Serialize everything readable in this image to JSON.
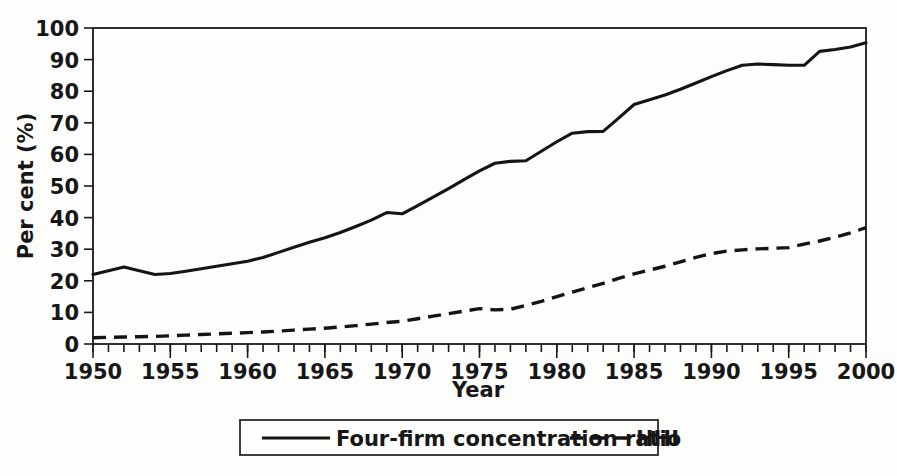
{
  "chart_data": {
    "type": "line",
    "title": "",
    "xlabel": "Year",
    "ylabel": "Per cent (%)",
    "xlim": [
      1950,
      2000
    ],
    "ylim": [
      0,
      100
    ],
    "grid": false,
    "legend_position": "bottom",
    "x_tick_labels": [
      "1950",
      "1955",
      "1960",
      "1965",
      "1970",
      "1975",
      "1980",
      "1985",
      "1990",
      "1995",
      "2000"
    ],
    "x_tick_values": [
      1950,
      1955,
      1960,
      1965,
      1970,
      1975,
      1980,
      1985,
      1990,
      1995,
      2000
    ],
    "x_minor_tick_step": 1,
    "y_tick_labels": [
      "0",
      "10",
      "20",
      "30",
      "40",
      "50",
      "60",
      "70",
      "80",
      "90",
      "100"
    ],
    "y_tick_values": [
      0,
      10,
      20,
      30,
      40,
      50,
      60,
      70,
      80,
      90,
      100
    ],
    "x": [
      1950,
      1951,
      1952,
      1953,
      1954,
      1955,
      1956,
      1957,
      1958,
      1959,
      1960,
      1961,
      1962,
      1963,
      1964,
      1965,
      1966,
      1967,
      1968,
      1969,
      1970,
      1971,
      1972,
      1973,
      1974,
      1975,
      1976,
      1977,
      1978,
      1979,
      1980,
      1981,
      1982,
      1983,
      1984,
      1985,
      1986,
      1987,
      1988,
      1989,
      1990,
      1991,
      1992,
      1993,
      1994,
      1995,
      1996,
      1997,
      1998,
      1999,
      2000
    ],
    "series": [
      {
        "name": "Four-firm concentration ratio",
        "style": "solid",
        "values": [
          22.0,
          23.2,
          24.4,
          23.2,
          22.0,
          22.3,
          23.0,
          23.8,
          24.6,
          25.4,
          26.2,
          27.4,
          29.0,
          30.6,
          32.2,
          33.6,
          35.3,
          37.2,
          39.2,
          41.6,
          41.2,
          43.8,
          46.5,
          49.2,
          52.0,
          54.8,
          57.2,
          57.8,
          58.0,
          61.0,
          64.0,
          66.7,
          67.2,
          67.3,
          71.5,
          75.8,
          77.3,
          78.8,
          80.6,
          82.6,
          84.6,
          86.5,
          88.2,
          88.6,
          88.4,
          88.2,
          88.2,
          92.6,
          93.2,
          94.0,
          95.3
        ]
      },
      {
        "name": "HHI",
        "style": "dashed",
        "values": [
          2.0,
          2.1,
          2.2,
          2.3,
          2.4,
          2.6,
          2.8,
          3.0,
          3.2,
          3.4,
          3.6,
          3.8,
          4.1,
          4.4,
          4.7,
          5.0,
          5.4,
          5.8,
          6.3,
          6.8,
          7.2,
          8.0,
          8.8,
          9.6,
          10.4,
          11.2,
          10.8,
          11.0,
          12.2,
          13.5,
          15.0,
          16.4,
          17.8,
          19.2,
          20.8,
          22.2,
          23.4,
          24.6,
          26.0,
          27.4,
          28.6,
          29.4,
          29.8,
          30.1,
          30.3,
          30.5,
          31.6,
          32.6,
          33.8,
          35.2,
          36.8
        ]
      }
    ],
    "legend_entries": [
      {
        "label": "Four-firm concentration ratio",
        "style": "solid"
      },
      {
        "label": "HHI",
        "style": "dashed"
      }
    ]
  }
}
